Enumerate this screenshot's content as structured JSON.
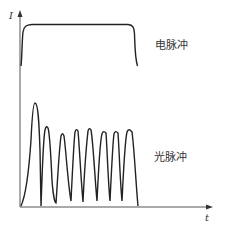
{
  "diagram": {
    "type": "waveform",
    "axes": {
      "y_label": "I",
      "x_label": "t"
    },
    "labels": {
      "electric_pulse": "电脉冲",
      "light_pulse": "光脉冲"
    },
    "colors": {
      "stroke": "#222222",
      "axis": "#555555",
      "text": "#333333"
    },
    "electric_pulse": {
      "description": "rectangular pulse with rounded corners and slight overshoot at start",
      "start_x": 21,
      "end_x": 137,
      "top_y": 24,
      "base_y": 65
    },
    "light_pulse": {
      "description": "damped relaxation oscillation spikes",
      "peak_count": 8,
      "peaks": [
        {
          "x": 35,
          "y": 103
        },
        {
          "x": 48,
          "y": 128
        },
        {
          "x": 63,
          "y": 134
        },
        {
          "x": 77,
          "y": 130
        },
        {
          "x": 90,
          "y": 129
        },
        {
          "x": 104,
          "y": 132
        },
        {
          "x": 116,
          "y": 132
        },
        {
          "x": 129,
          "y": 130
        }
      ],
      "troughs": [
        {
          "x": 41,
          "y": 206
        },
        {
          "x": 56,
          "y": 203
        },
        {
          "x": 71,
          "y": 201
        },
        {
          "x": 83,
          "y": 202
        },
        {
          "x": 97,
          "y": 201
        },
        {
          "x": 110,
          "y": 201
        },
        {
          "x": 122,
          "y": 201
        }
      ],
      "end_x": 138
    }
  }
}
